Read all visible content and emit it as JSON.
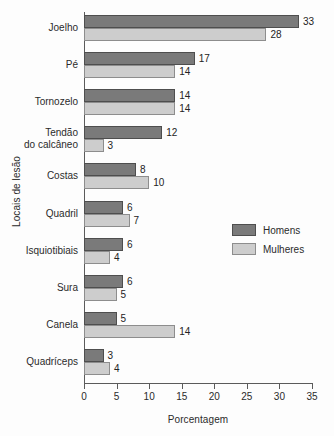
{
  "chart_data": {
    "type": "bar",
    "orientation": "horizontal",
    "title": "",
    "xlabel": "Porcentagem",
    "ylabel": "Locais de lesão",
    "xlim": [
      0,
      35
    ],
    "xticks": [
      0,
      5,
      10,
      15,
      20,
      25,
      30,
      35
    ],
    "grid": false,
    "legend_position": "right",
    "categories": [
      "Joelho",
      "Pé",
      "Tornozelo",
      "Tendão\ndo calcâneo",
      "Costas",
      "Quadril",
      "Isquiotibiais",
      "Sura",
      "Canela",
      "Quadríceps"
    ],
    "series": [
      {
        "name": "Homens",
        "color": "#7a7a7a",
        "values": [
          33,
          17,
          14,
          12,
          8,
          6,
          6,
          6,
          5,
          3
        ]
      },
      {
        "name": "Mulheres",
        "color": "#cdcdcd",
        "values": [
          28,
          14,
          14,
          3,
          10,
          7,
          4,
          5,
          14,
          4
        ]
      }
    ]
  },
  "legend": {
    "items": [
      {
        "label": "Homens"
      },
      {
        "label": "Mulheres"
      }
    ]
  }
}
